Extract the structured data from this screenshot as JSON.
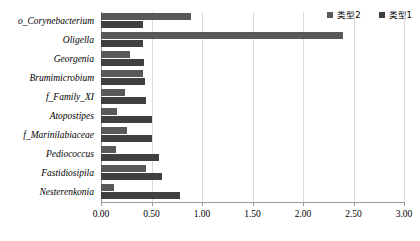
{
  "chart_data": {
    "type": "bar",
    "orientation": "horizontal",
    "title": "",
    "xlabel": "",
    "ylabel": "",
    "xlim": [
      0.0,
      3.0
    ],
    "xticks": [
      "0.00",
      "0.50",
      "1.00",
      "1.50",
      "2.00",
      "2.50",
      "3.00"
    ],
    "xtick_values": [
      0.0,
      0.5,
      1.0,
      1.5,
      2.0,
      2.5,
      3.0
    ],
    "grid": true,
    "legend_position": "top-right",
    "categories": [
      "o__Corynebacterium",
      "Oligella",
      "Georgenia",
      "Brumimicrobium",
      "f__Family_XI",
      "Atopostipes",
      "f__Marinilabiaceae",
      "Pediococcus",
      "Fastidiosipila",
      "Nesterenkonia"
    ],
    "series": [
      {
        "name": "类型2",
        "color": "#595959",
        "values": [
          0.89,
          2.4,
          0.29,
          0.42,
          0.24,
          0.16,
          0.26,
          0.15,
          0.45,
          0.13
        ]
      },
      {
        "name": "类型1",
        "color": "#404040",
        "values": [
          0.42,
          0.42,
          0.43,
          0.44,
          0.45,
          0.5,
          0.5,
          0.57,
          0.6,
          0.78
        ]
      }
    ]
  },
  "legend": {
    "entries": [
      {
        "label": "类型2",
        "color": "#595959"
      },
      {
        "label": "类型1",
        "color": "#404040"
      }
    ]
  },
  "axis": {
    "ticks": [
      {
        "label": "0.00"
      },
      {
        "label": "0.50"
      },
      {
        "label": "1.00"
      },
      {
        "label": "1.50"
      },
      {
        "label": "2.00"
      },
      {
        "label": "2.50"
      },
      {
        "label": "3.00"
      }
    ]
  },
  "categories_labels": [
    {
      "label": "o_Corynebacterium"
    },
    {
      "label": "Oligella"
    },
    {
      "label": "Georgenia"
    },
    {
      "label": "Brumimicrobium"
    },
    {
      "label": "f_Family_XI"
    },
    {
      "label": "Atopostipes"
    },
    {
      "label": "f_Marinilabiaceae"
    },
    {
      "label": "Pediococcus"
    },
    {
      "label": "Fastidiosipila"
    },
    {
      "label": "Nesterenkonia"
    }
  ]
}
